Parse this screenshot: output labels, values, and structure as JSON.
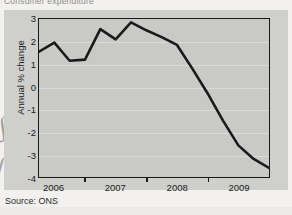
{
  "figure": {
    "title": "Consumer expenditure",
    "source_label": "Source: ONS",
    "background_color": "#cfcfcd",
    "plot_background_color": "#c9c9c7",
    "line_color": "#1a1a1a",
    "axis_color": "#1a1a1a"
  },
  "scan_artifacts": {
    "pen_mark_left": "∫",
    "ghost_text_1": "",
    "ghost_text_2": ""
  },
  "chart_data": {
    "type": "line",
    "title": "Consumer expenditure",
    "subtitle": "",
    "xlabel": "",
    "ylabel": "Annual % change",
    "ylim": [
      -4,
      3
    ],
    "xlim": [
      2005.75,
      2009.5
    ],
    "grid": true,
    "legend_position": "none",
    "y_ticks": [
      3,
      2,
      1,
      0,
      -1,
      -2,
      -3,
      -4
    ],
    "y_tick_labels": [
      "3",
      "2",
      "1",
      "0",
      "-1",
      "-2",
      "-3",
      "-4"
    ],
    "x_ticks": [
      2006,
      2007,
      2008,
      2009
    ],
    "x_tick_labels": [
      "2006",
      "2007",
      "2008",
      "2009"
    ],
    "series": [
      {
        "name": "Consumer expenditure, annual % change",
        "x": [
          2005.75,
          2006.0,
          2006.25,
          2006.5,
          2006.75,
          2007.0,
          2007.25,
          2007.5,
          2007.75,
          2008.0,
          2008.25,
          2008.5,
          2008.75,
          2009.0,
          2009.25,
          2009.5
        ],
        "x_labels": [
          "2005 Q4",
          "2006 Q1",
          "2006 Q2",
          "2006 Q3",
          "2006 Q4",
          "2007 Q1",
          "2007 Q2",
          "2007 Q3",
          "2007 Q4",
          "2008 Q1",
          "2008 Q2",
          "2008 Q3",
          "2008 Q4",
          "2009 Q1",
          "2009 Q2",
          "2009 Q3"
        ],
        "values": [
          1.55,
          1.95,
          1.15,
          1.2,
          2.55,
          2.1,
          2.85,
          2.5,
          2.2,
          1.85,
          0.8,
          -0.3,
          -1.5,
          -2.6,
          -3.2,
          -3.6
        ]
      }
    ]
  }
}
